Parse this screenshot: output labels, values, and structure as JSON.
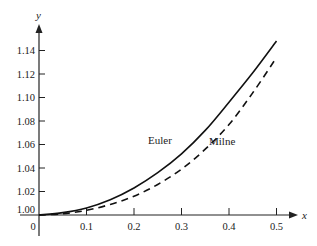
{
  "chart_data": {
    "type": "line",
    "title": "",
    "xlabel": "x",
    "ylabel": "y",
    "xlim": [
      0,
      0.5
    ],
    "ylim": [
      1.0,
      1.15
    ],
    "grid": false,
    "legend": "inline labels",
    "x_ticks": [
      "0",
      "0.1",
      "0.2",
      "0.3",
      "0.4",
      "0.5"
    ],
    "y_ticks": [
      "1.00",
      "1.02",
      "1.04",
      "1.06",
      "1.08",
      "1.10",
      "1.12",
      "1.14"
    ],
    "x": [
      0,
      0.05,
      0.1,
      0.15,
      0.2,
      0.25,
      0.3,
      0.35,
      0.4,
      0.45,
      0.5
    ],
    "series": [
      {
        "name": "Euler",
        "style": "solid",
        "values": [
          1.0,
          1.002,
          1.006,
          1.013,
          1.023,
          1.036,
          1.052,
          1.072,
          1.096,
          1.121,
          1.148
        ]
      },
      {
        "name": "Milne",
        "style": "dashed",
        "values": [
          1.0,
          1.001,
          1.004,
          1.009,
          1.016,
          1.026,
          1.039,
          1.056,
          1.077,
          1.104,
          1.134
        ]
      }
    ],
    "annotations": [
      "Euler",
      "Milne"
    ]
  },
  "labels": {
    "x_axis": "x",
    "y_axis": "y",
    "origin": "0",
    "euler": "Euler",
    "milne": "Milne"
  }
}
